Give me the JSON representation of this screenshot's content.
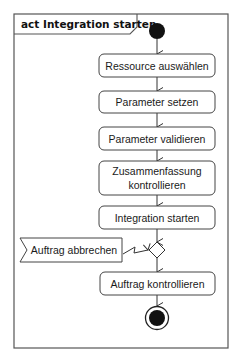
{
  "diagram": {
    "type": "UML activity diagram",
    "frame_title": "act Integration starten",
    "start_node": "initial",
    "actions": [
      {
        "id": "a1",
        "label_lines": [
          "Ressource auswählen"
        ]
      },
      {
        "id": "a2",
        "label_lines": [
          "Parameter setzen"
        ]
      },
      {
        "id": "a3",
        "label_lines": [
          "Parameter validieren"
        ]
      },
      {
        "id": "a4",
        "label_lines": [
          "Zusammenfassung",
          "kontrollieren"
        ]
      },
      {
        "id": "a5",
        "label_lines": [
          "Integration starten"
        ]
      },
      {
        "id": "a6",
        "label_lines": [
          "Auftrag kontrollieren"
        ]
      }
    ],
    "accept_event": {
      "label": "Auftrag abbrechen"
    },
    "merge_node": "decision",
    "end_node": "final",
    "colors": {
      "line": "#333333",
      "fill": "#ffffff",
      "node": "#111111"
    }
  }
}
